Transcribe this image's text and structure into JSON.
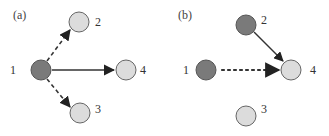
{
  "colors": {
    "dark_node": "#7a7a7a",
    "light_node": "#dcdcdc",
    "stroke": "#555555",
    "edge": "#333333"
  },
  "panels": [
    {
      "label": "(a)",
      "nodes": [
        {
          "id": "1",
          "label": "1",
          "state": "dark"
        },
        {
          "id": "2",
          "label": "2",
          "state": "light"
        },
        {
          "id": "3",
          "label": "3",
          "state": "light"
        },
        {
          "id": "4",
          "label": "4",
          "state": "light"
        }
      ],
      "edges": [
        {
          "from": "1",
          "to": "2",
          "style": "dashed"
        },
        {
          "from": "1",
          "to": "3",
          "style": "dashed"
        },
        {
          "from": "1",
          "to": "4",
          "style": "solid"
        }
      ]
    },
    {
      "label": "(b)",
      "nodes": [
        {
          "id": "1",
          "label": "1",
          "state": "dark"
        },
        {
          "id": "2",
          "label": "2",
          "state": "dark"
        },
        {
          "id": "3",
          "label": "3",
          "state": "light"
        },
        {
          "id": "4",
          "label": "4",
          "state": "light"
        }
      ],
      "edges": [
        {
          "from": "2",
          "to": "4",
          "style": "solid"
        },
        {
          "from": "1",
          "to": "4",
          "style": "dotted"
        }
      ]
    }
  ]
}
